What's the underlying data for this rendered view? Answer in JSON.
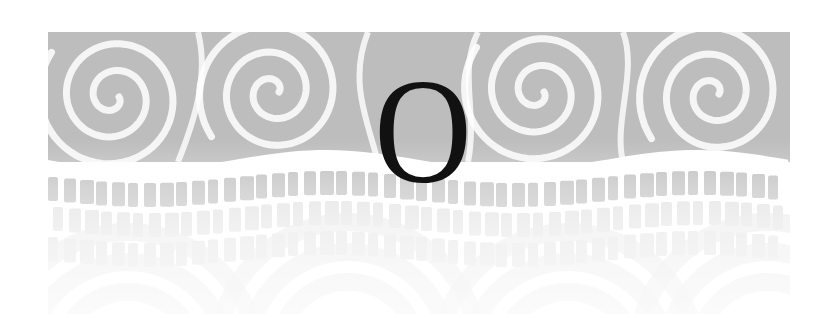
{
  "page": {
    "type": "chapter-opening-banner",
    "drop_cap": "O",
    "pattern": "koru-spiral",
    "colors": {
      "background": "#ffffff",
      "pattern_gray": "#bdbdbd",
      "pattern_light": "#dedede",
      "letter": "#111111"
    }
  }
}
